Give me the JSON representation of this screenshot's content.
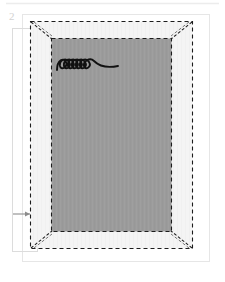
{
  "figure": {
    "label": "2",
    "label_color": "#d2d2d2",
    "page": {
      "border_color": "#e6e6e6",
      "background": "#ffffff",
      "x": 22,
      "y": 14,
      "width": 188,
      "height": 248
    },
    "outer_frame": {
      "name": "dashed-outer-frame",
      "stroke": "#1c1c1c",
      "fill": "#f4f4f4",
      "dash": "4 3",
      "stroke_width": 1.1,
      "x": 30,
      "y": 21,
      "width": 163,
      "height": 228
    },
    "inner_panel": {
      "name": "dashed-inner-panel",
      "stroke": "#1c1c1c",
      "fill": "#9b9b9b",
      "dash": "4 3",
      "stroke_width": 1.1,
      "x": 51,
      "y": 38,
      "width": 121,
      "height": 194
    },
    "corner_miters": {
      "name": "corner-miter-lines",
      "stroke": "#1c1c1c",
      "dash": "3 2",
      "count": 4,
      "description": "diagonal dashed lines joining outer frame corners to inner panel corners"
    },
    "coil": {
      "name": "coil-spring-sketch",
      "stroke": "#111111",
      "loops": 7,
      "x": 57,
      "y": 57,
      "width": 65,
      "height": 16
    },
    "callout_box": {
      "name": "left-callout-box",
      "stroke": "#d8d8d8",
      "x": 12,
      "y": 28,
      "width": 26,
      "height": 224
    },
    "arrow": {
      "name": "pointer-arrow",
      "stroke": "#8c8c8c",
      "direction": "right",
      "from_x": 13,
      "to_x": 33,
      "y": 214
    },
    "top_rule": {
      "name": "top-divider-rule",
      "stroke": "#ececec",
      "x1": 6,
      "x2": 219,
      "y": 3
    }
  }
}
